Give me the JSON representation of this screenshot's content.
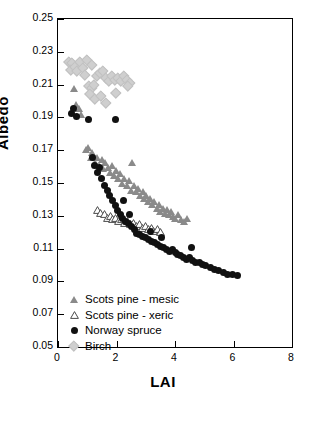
{
  "chart_data": {
    "type": "scatter",
    "title": "",
    "xlabel": "LAI",
    "ylabel": "Albedo",
    "xlim": [
      0,
      8
    ],
    "ylim": [
      0.05,
      0.25
    ],
    "xticks": [
      0,
      2,
      4,
      6,
      8
    ],
    "yticks": [
      "0.05",
      "0.07",
      "0.09",
      "0.11",
      "0.13",
      "0.15",
      "0.17",
      "0.19",
      "0.21",
      "0.23",
      "0.25"
    ],
    "grid": false,
    "legend_position": "bottom-left",
    "series": [
      {
        "name": "Scots pine - mesic",
        "marker": "filled-triangle",
        "color": "#8a8a8a",
        "points": [
          [
            0.55,
            0.2075
          ],
          [
            0.62,
            0.1975
          ],
          [
            0.72,
            0.1955
          ],
          [
            0.78,
            0.1915
          ],
          [
            0.95,
            0.1705
          ],
          [
            1.02,
            0.1715
          ],
          [
            1.12,
            0.1655
          ],
          [
            1.18,
            0.1685
          ],
          [
            1.28,
            0.1625
          ],
          [
            1.35,
            0.1655
          ],
          [
            1.42,
            0.1605
          ],
          [
            1.5,
            0.1645
          ],
          [
            1.55,
            0.1585
          ],
          [
            1.62,
            0.1625
          ],
          [
            1.7,
            0.1595
          ],
          [
            1.78,
            0.1565
          ],
          [
            1.85,
            0.1605
          ],
          [
            1.92,
            0.1545
          ],
          [
            2.0,
            0.1575
          ],
          [
            2.05,
            0.1525
          ],
          [
            2.12,
            0.1555
          ],
          [
            2.2,
            0.1495
          ],
          [
            2.28,
            0.1525
          ],
          [
            2.35,
            0.1485
          ],
          [
            2.42,
            0.1515
          ],
          [
            2.5,
            0.1455
          ],
          [
            2.55,
            0.1625
          ],
          [
            2.6,
            0.1485
          ],
          [
            2.68,
            0.1445
          ],
          [
            2.75,
            0.1465
          ],
          [
            2.82,
            0.1425
          ],
          [
            2.9,
            0.1445
          ],
          [
            2.95,
            0.1405
          ],
          [
            3.02,
            0.1425
          ],
          [
            3.1,
            0.1385
          ],
          [
            3.15,
            0.1405
          ],
          [
            3.22,
            0.1365
          ],
          [
            3.3,
            0.1385
          ],
          [
            3.38,
            0.1345
          ],
          [
            3.45,
            0.1365
          ],
          [
            3.5,
            0.1325
          ],
          [
            3.58,
            0.1345
          ],
          [
            3.65,
            0.1315
          ],
          [
            3.72,
            0.1335
          ],
          [
            3.8,
            0.1305
          ],
          [
            3.88,
            0.1325
          ],
          [
            3.95,
            0.1295
          ],
          [
            4.02,
            0.1285
          ],
          [
            4.1,
            0.1305
          ],
          [
            4.2,
            0.1275
          ],
          [
            4.3,
            0.1265
          ],
          [
            4.4,
            0.1285
          ]
        ]
      },
      {
        "name": "Scots pine - xeric",
        "marker": "open-triangle",
        "color": "#555555",
        "points": [
          [
            1.35,
            0.1375
          ],
          [
            1.45,
            0.1355
          ],
          [
            1.58,
            0.1345
          ],
          [
            1.68,
            0.1325
          ],
          [
            1.78,
            0.1335
          ],
          [
            1.88,
            0.1315
          ],
          [
            1.98,
            0.1325
          ],
          [
            2.08,
            0.1305
          ],
          [
            2.18,
            0.1315
          ],
          [
            2.28,
            0.1295
          ],
          [
            2.38,
            0.1305
          ],
          [
            2.48,
            0.1285
          ],
          [
            2.58,
            0.1295
          ],
          [
            2.68,
            0.1275
          ],
          [
            2.78,
            0.1285
          ],
          [
            2.88,
            0.1265
          ],
          [
            2.98,
            0.1275
          ],
          [
            3.08,
            0.1255
          ],
          [
            3.18,
            0.1265
          ],
          [
            3.28,
            0.1245
          ],
          [
            3.4,
            0.1255
          ],
          [
            3.5,
            0.1235
          ]
        ]
      },
      {
        "name": "Norway spruce",
        "marker": "filled-circle",
        "color": "#111111",
        "points": [
          [
            0.45,
            0.1925
          ],
          [
            0.52,
            0.1955
          ],
          [
            0.62,
            0.1905
          ],
          [
            1.05,
            0.1885
          ],
          [
            1.95,
            0.1885
          ],
          [
            1.18,
            0.1655
          ],
          [
            1.25,
            0.1605
          ],
          [
            1.35,
            0.1565
          ],
          [
            1.42,
            0.1595
          ],
          [
            1.5,
            0.1525
          ],
          [
            1.6,
            0.1485
          ],
          [
            1.68,
            0.1455
          ],
          [
            1.75,
            0.1425
          ],
          [
            1.85,
            0.1395
          ],
          [
            1.95,
            0.1365
          ],
          [
            2.05,
            0.1335
          ],
          [
            2.12,
            0.1305
          ],
          [
            2.2,
            0.1285
          ],
          [
            2.3,
            0.1265
          ],
          [
            2.4,
            0.1255
          ],
          [
            2.5,
            0.1235
          ],
          [
            2.6,
            0.1215
          ],
          [
            2.7,
            0.1195
          ],
          [
            2.8,
            0.1185
          ],
          [
            2.9,
            0.1175
          ],
          [
            3.0,
            0.1165
          ],
          [
            3.1,
            0.1155
          ],
          [
            3.2,
            0.1145
          ],
          [
            3.3,
            0.1135
          ],
          [
            3.4,
            0.1125
          ],
          [
            3.5,
            0.1115
          ],
          [
            3.6,
            0.1105
          ],
          [
            3.7,
            0.1095
          ],
          [
            3.8,
            0.1085
          ],
          [
            3.9,
            0.1095
          ],
          [
            4.0,
            0.1075
          ],
          [
            4.1,
            0.1065
          ],
          [
            4.2,
            0.1055
          ],
          [
            4.3,
            0.1045
          ],
          [
            4.4,
            0.1035
          ],
          [
            4.5,
            0.1045
          ],
          [
            4.6,
            0.1025
          ],
          [
            4.7,
            0.1015
          ],
          [
            4.85,
            0.1015
          ],
          [
            4.95,
            0.1005
          ],
          [
            5.05,
            0.0995
          ],
          [
            5.2,
            0.0985
          ],
          [
            5.35,
            0.0975
          ],
          [
            5.5,
            0.0965
          ],
          [
            5.65,
            0.0955
          ],
          [
            5.8,
            0.0945
          ],
          [
            5.95,
            0.0945
          ],
          [
            6.15,
            0.0935
          ],
          [
            4.55,
            0.1105
          ],
          [
            2.25,
            0.1395
          ],
          [
            2.45,
            0.1305
          ],
          [
            3.15,
            0.1205
          ],
          [
            3.55,
            0.1165
          ]
        ]
      },
      {
        "name": "Birch",
        "marker": "diamond",
        "color": "#cfcfcf",
        "points": [
          [
            0.35,
            0.2245
          ],
          [
            0.45,
            0.2235
          ],
          [
            0.42,
            0.2195
          ],
          [
            0.55,
            0.2215
          ],
          [
            0.62,
            0.2185
          ],
          [
            0.72,
            0.2245
          ],
          [
            0.82,
            0.2205
          ],
          [
            0.9,
            0.2165
          ],
          [
            1.02,
            0.2095
          ],
          [
            1.12,
            0.2085
          ],
          [
            1.22,
            0.2105
          ],
          [
            1.32,
            0.2155
          ],
          [
            1.42,
            0.2175
          ],
          [
            1.52,
            0.2185
          ],
          [
            1.62,
            0.2145
          ],
          [
            1.72,
            0.2125
          ],
          [
            1.82,
            0.2155
          ],
          [
            1.92,
            0.2135
          ],
          [
            2.02,
            0.2145
          ],
          [
            2.12,
            0.2125
          ],
          [
            2.22,
            0.2155
          ],
          [
            2.32,
            0.2135
          ],
          [
            2.42,
            0.2115
          ],
          [
            1.05,
            0.2045
          ],
          [
            1.25,
            0.2015
          ],
          [
            1.45,
            0.2035
          ],
          [
            1.6,
            0.1995
          ],
          [
            1.95,
            0.2055
          ],
          [
            2.35,
            0.2095
          ],
          [
            0.95,
            0.2255
          ],
          [
            1.15,
            0.2225
          ]
        ]
      }
    ]
  },
  "legend": {
    "items": [
      {
        "label": "Scots pine - mesic",
        "marker": "filled-triangle"
      },
      {
        "label": "Scots pine - xeric",
        "marker": "open-triangle"
      },
      {
        "label": "Norway spruce",
        "marker": "filled-circle"
      },
      {
        "label": "Birch",
        "marker": "diamond"
      }
    ]
  }
}
